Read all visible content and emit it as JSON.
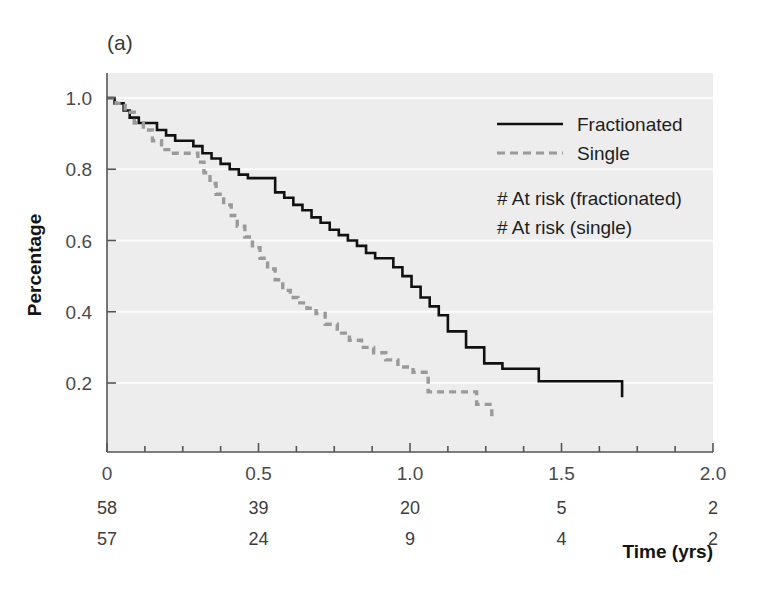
{
  "figure": {
    "panel_label": "(a)",
    "background_color": "#ffffff",
    "plot_background_color": "#ededed"
  },
  "chart_data": {
    "type": "line",
    "title": "",
    "subtitle": "",
    "xlabel": "Time (yrs)",
    "ylabel": "Percentage",
    "xlim": [
      0,
      2.0
    ],
    "ylim": [
      0,
      1.06
    ],
    "xticks": [
      0,
      0.5,
      1.0,
      1.5,
      2.0
    ],
    "xtick_labels": [
      "0",
      "0.5",
      "1.0",
      "1.5",
      "2.0"
    ],
    "yticks": [
      0.2,
      0.4,
      0.6,
      0.8,
      1.0
    ],
    "ytick_labels": [
      "0.2",
      "0.4",
      "0.6",
      "0.8",
      "1.0"
    ],
    "grid": "horizontal",
    "legend_position": "upper right",
    "legend": [
      {
        "label": "Fractionated",
        "style": "solid",
        "color": "#111111"
      },
      {
        "label": "Single",
        "style": "dashed",
        "color": "#9a9a9a"
      }
    ],
    "risk_table": {
      "times": [
        0,
        0.5,
        1.0,
        1.5,
        2.0
      ],
      "rows": [
        {
          "label": "# At risk (fractionated)",
          "values": [
            58,
            39,
            20,
            5,
            2
          ]
        },
        {
          "label": "# At risk (single)",
          "values": [
            57,
            24,
            9,
            4,
            2
          ]
        }
      ]
    },
    "series": [
      {
        "name": "Fractionated",
        "style": "solid",
        "color": "#111111",
        "step": "post",
        "x": [
          0.0,
          0.025,
          0.055,
          0.075,
          0.105,
          0.135,
          0.165,
          0.195,
          0.225,
          0.255,
          0.285,
          0.315,
          0.345,
          0.375,
          0.405,
          0.435,
          0.465,
          0.495,
          0.525,
          0.555,
          0.585,
          0.615,
          0.645,
          0.675,
          0.705,
          0.735,
          0.765,
          0.795,
          0.825,
          0.855,
          0.885,
          0.915,
          0.945,
          0.975,
          1.005,
          1.035,
          1.065,
          1.095,
          1.125,
          1.185,
          1.245,
          1.305,
          1.425,
          1.7
        ],
        "y": [
          1.0,
          0.985,
          0.965,
          0.945,
          0.93,
          0.93,
          0.91,
          0.895,
          0.88,
          0.88,
          0.865,
          0.845,
          0.83,
          0.815,
          0.8,
          0.785,
          0.775,
          0.775,
          0.775,
          0.735,
          0.72,
          0.7,
          0.685,
          0.665,
          0.65,
          0.63,
          0.615,
          0.6,
          0.585,
          0.565,
          0.55,
          0.55,
          0.525,
          0.5,
          0.47,
          0.44,
          0.415,
          0.39,
          0.345,
          0.3,
          0.255,
          0.24,
          0.205,
          0.16
        ]
      },
      {
        "name": "Single",
        "style": "dashed",
        "color": "#9a9a9a",
        "step": "post",
        "x": [
          0.0,
          0.03,
          0.06,
          0.09,
          0.12,
          0.15,
          0.18,
          0.21,
          0.24,
          0.27,
          0.3,
          0.32,
          0.34,
          0.36,
          0.385,
          0.41,
          0.43,
          0.455,
          0.48,
          0.505,
          0.53,
          0.555,
          0.58,
          0.605,
          0.63,
          0.66,
          0.69,
          0.72,
          0.76,
          0.8,
          0.84,
          0.88,
          0.92,
          0.96,
          1.01,
          1.06,
          1.11,
          1.17,
          1.22,
          1.27
        ],
        "y": [
          1.0,
          0.985,
          0.96,
          0.93,
          0.91,
          0.88,
          0.855,
          0.845,
          0.845,
          0.845,
          0.82,
          0.79,
          0.76,
          0.73,
          0.7,
          0.67,
          0.64,
          0.61,
          0.58,
          0.55,
          0.52,
          0.49,
          0.46,
          0.44,
          0.425,
          0.41,
          0.395,
          0.365,
          0.34,
          0.32,
          0.3,
          0.285,
          0.265,
          0.245,
          0.23,
          0.175,
          0.175,
          0.175,
          0.14,
          0.105
        ]
      }
    ]
  }
}
